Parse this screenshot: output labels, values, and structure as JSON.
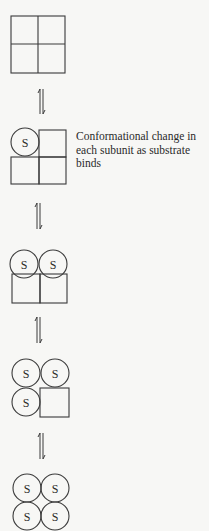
{
  "diagram": {
    "stroke_color": "#3a3a3a",
    "background": "#f7f7f5",
    "substrate_label": "S",
    "equilibrium_symbol": "⇌",
    "caption": {
      "lines": [
        "Conformational change in",
        "each subunit as substrate",
        "binds"
      ]
    },
    "states": [
      {
        "name": "state-0-bound",
        "bound_subunits": 0,
        "circles": [],
        "squares": [
          "top-left",
          "top-right",
          "bottom-left",
          "bottom-right"
        ]
      },
      {
        "name": "state-1-bound",
        "bound_subunits": 1,
        "circles": [
          "top-left"
        ],
        "squares": [
          "top-right",
          "bottom-left",
          "bottom-right"
        ]
      },
      {
        "name": "state-2-bound",
        "bound_subunits": 2,
        "circles": [
          "top-left",
          "top-right"
        ],
        "squares": [
          "bottom-left",
          "bottom-right"
        ]
      },
      {
        "name": "state-3-bound",
        "bound_subunits": 3,
        "circles": [
          "top-left",
          "top-right",
          "bottom-left"
        ],
        "squares": [
          "bottom-right"
        ]
      },
      {
        "name": "state-4-bound",
        "bound_subunits": 4,
        "circles": [
          "top-left",
          "top-right",
          "bottom-left",
          "bottom-right"
        ],
        "squares": []
      }
    ],
    "arrow_count": 4
  }
}
